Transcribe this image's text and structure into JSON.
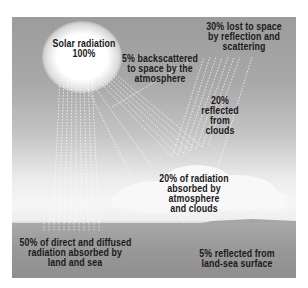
{
  "diagram": {
    "type": "earth-energy-budget",
    "colors": {
      "sky_top": "#9c9c9c",
      "sky_mid": "#c4c4c4",
      "horizon": "#f6f6f6",
      "ground": "#9a9a9a",
      "text": "#1a1a1a",
      "rays": "#ffffff"
    },
    "labels": {
      "solar": {
        "line1": "Solar radiation",
        "line2": "100%"
      },
      "backscatter": {
        "line1": "5% backscattered",
        "line2": "to space by the",
        "line3": "atmosphere"
      },
      "lost": {
        "line1": "30% lost to space",
        "line2": "by reflection and",
        "line3": "scattering"
      },
      "clouds_reflected": {
        "line1": "20%",
        "line2": "reflected",
        "line3": "from",
        "line4": "clouds"
      },
      "absorbed_atmo": {
        "line1": "20% of radiation",
        "line2": "absorbed by",
        "line3": "atmosphere",
        "line4": "and clouds"
      },
      "absorbed_land": {
        "line1": "50% of direct and diffused",
        "line2": "radiation absorbed by",
        "line3": "land and sea"
      },
      "surface_reflected": {
        "line1": "5% reflected from",
        "line2": "land-sea surface"
      }
    }
  }
}
